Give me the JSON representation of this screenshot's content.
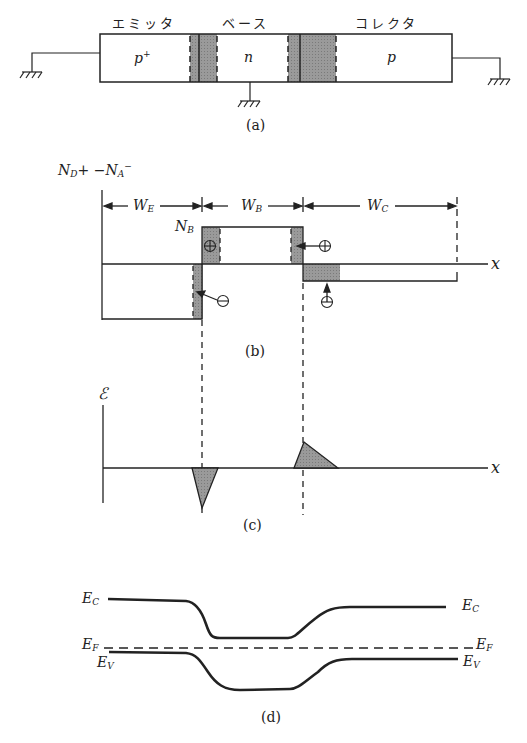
{
  "panel_a": {
    "regions": [
      "エミッタ",
      "ベース",
      "コレクタ"
    ],
    "doping": [
      "p",
      "n",
      "p"
    ],
    "emitter_sup": "+",
    "caption": "(a)"
  },
  "panel_b": {
    "ylabel_main": "N",
    "ylabel_sub1": "D",
    "ylabel_mid": "+ −N",
    "ylabel_sub2": "A",
    "ylabel_end": "−",
    "widths": [
      "W",
      "W",
      "W"
    ],
    "width_subs": [
      "E",
      "B",
      "C"
    ],
    "nb_label": "N",
    "nb_sub": "B",
    "xlabel": "x",
    "charges": [
      "⊕",
      "⊕",
      "⊖",
      "⊖"
    ],
    "caption": "(b)"
  },
  "panel_c": {
    "ylabel": "ℰ",
    "xlabel": "x",
    "caption": "(c)"
  },
  "panel_d": {
    "labels": {
      "ec": "E",
      "ec_sub": "C",
      "ef": "E",
      "ef_sub": "F",
      "ev": "E",
      "ev_sub": "V"
    },
    "caption": "(d)"
  }
}
